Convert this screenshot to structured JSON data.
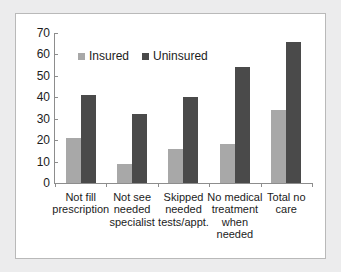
{
  "chart_data": {
    "type": "bar",
    "title": "",
    "subtitle": "",
    "xlabel": "",
    "ylabel": "",
    "ylim": [
      0,
      70
    ],
    "ytick_step": 10,
    "yticks": [
      "0",
      "10",
      "20",
      "30",
      "40",
      "50",
      "60",
      "70"
    ],
    "grid": false,
    "legend_position": "top-left-inside",
    "categories": [
      "Not fill prescription",
      "Not see needed specialist",
      "Skipped needed tests/appt.",
      "No medical treatment when needed",
      "Total no care"
    ],
    "category_label_lines": [
      [
        "Not fill",
        "prescription"
      ],
      [
        "Not see",
        "needed",
        "specialist"
      ],
      [
        "Skipped",
        "needed",
        "tests/appt."
      ],
      [
        "No medical",
        "treatment",
        "when",
        "needed"
      ],
      [
        "Total no",
        "care"
      ]
    ],
    "series": [
      {
        "name": "Insured",
        "color": "#a8a8a8",
        "values": [
          21,
          9,
          16,
          18,
          34
        ]
      },
      {
        "name": "Uninsured",
        "color": "#4a4a4a",
        "values": [
          41,
          32,
          40,
          54,
          66
        ]
      }
    ]
  },
  "legend": {
    "items": [
      {
        "label": "Insured",
        "swatch": "legend-swatch-insured"
      },
      {
        "label": "Uninsured",
        "swatch": "legend-swatch-uninsured"
      }
    ]
  },
  "colors": {
    "insured": "#a8a8a8",
    "uninsured": "#4a4a4a",
    "axis": "#8d8d8d",
    "text": "#1c1c1c",
    "frame_border": "#b9b9b9",
    "page_margin": "#ececed",
    "plot_background": "#ffffff"
  }
}
